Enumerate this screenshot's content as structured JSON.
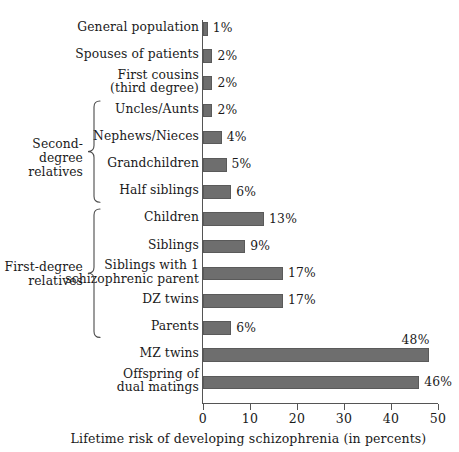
{
  "chart_data": {
    "type": "bar",
    "orientation": "horizontal",
    "title": "",
    "xlabel": "Lifetime risk of developing schizophrenia (in percents)",
    "ylabel": "",
    "xlim": [
      0,
      50
    ],
    "xticks": [
      0,
      10,
      20,
      30,
      40,
      50
    ],
    "xtick_labels": [
      "0",
      "10",
      "20",
      "30",
      "40",
      "50"
    ],
    "grid": false,
    "legend": "none",
    "bar_color": "#6e6e6e",
    "bar_edge_color": "#5a5a5a",
    "categories": [
      "General population",
      "Spouses of patients",
      "First cousins\n(third degree)",
      "Uncles/Aunts",
      "Nephews/Nieces",
      "Grandchildren",
      "Half siblings",
      "Children",
      "Siblings",
      "Siblings with 1\nschizophrenic parent",
      "DZ twins",
      "Parents",
      "MZ twins",
      "Offspring of\ndual matings"
    ],
    "values": [
      1,
      2,
      2,
      2,
      4,
      5,
      6,
      13,
      9,
      17,
      17,
      6,
      48,
      46
    ],
    "value_labels": [
      "1%",
      "2%",
      "2%",
      "2%",
      "4%",
      "5%",
      "6%",
      "13%",
      "9%",
      "17%",
      "17%",
      "6%",
      "48%",
      "46%"
    ],
    "groups": [
      {
        "label": "Second-degree\nrelatives",
        "first_index": 3,
        "last_index": 6
      },
      {
        "label": "First-degree\nrelatives",
        "first_index": 7,
        "last_index": 11
      }
    ]
  }
}
